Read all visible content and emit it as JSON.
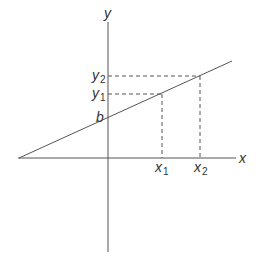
{
  "diagram": {
    "type": "linear-function-graph",
    "axes": {
      "x_label": "x",
      "y_label": "y"
    },
    "line": {
      "intercept_label": "b"
    },
    "points": [
      {
        "x_label": "x",
        "x_sub": "1",
        "y_label": "y",
        "y_sub": "1"
      },
      {
        "x_label": "x",
        "x_sub": "2",
        "y_label": "y",
        "y_sub": "2"
      }
    ],
    "colors": {
      "stroke": "#555555",
      "text": "#333333",
      "background": "#ffffff"
    }
  }
}
